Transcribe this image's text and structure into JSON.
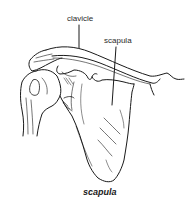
{
  "diagram": {
    "labels": [
      {
        "id": "clavicle",
        "text": "clavicle"
      },
      {
        "id": "scapula",
        "text": "scapula"
      }
    ],
    "caption": "scapula",
    "colors": {
      "line": "#1a1a1a",
      "background": "#ffffff"
    }
  }
}
